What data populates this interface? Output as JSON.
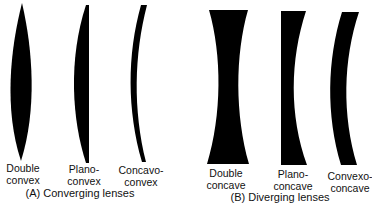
{
  "groups": [
    {
      "caption": "(A) Converging lenses",
      "lenses": [
        {
          "name": "double-convex",
          "line1": "Double",
          "line2": "convex"
        },
        {
          "name": "plano-convex",
          "line1": "Plano-",
          "line2": "convex"
        },
        {
          "name": "concavo-convex",
          "line1": "Concavo-",
          "line2": "convex"
        }
      ]
    },
    {
      "caption": "(B) Diverging lenses",
      "lenses": [
        {
          "name": "double-concave",
          "line1": "Double",
          "line2": "concave"
        },
        {
          "name": "plano-concave",
          "line1": "Plano-",
          "line2": "concave"
        },
        {
          "name": "convexo-concave",
          "line1": "Convexo-",
          "line2": "concave"
        }
      ]
    }
  ],
  "colors": {
    "lens_fill": "#000000",
    "background": "#ffffff",
    "text": "#111111"
  }
}
